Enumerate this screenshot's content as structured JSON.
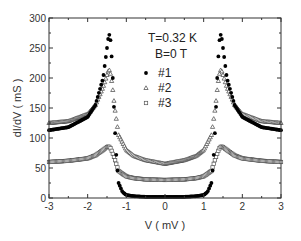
{
  "chart_data": {
    "type": "scatter",
    "title": "",
    "xlabel": "V ( mV )",
    "ylabel": "dI/dV ( mS )",
    "xlim": [
      -3,
      3
    ],
    "ylim": [
      0,
      300
    ],
    "xticks": [
      -3,
      -2,
      -1,
      0,
      1,
      2,
      3
    ],
    "yticks": [
      0,
      50,
      100,
      150,
      200,
      250,
      300
    ],
    "grid": false,
    "legend_position": "upper center",
    "annotations": [
      "T=0.32 K",
      "B=0 T"
    ],
    "series": [
      {
        "name": "#1",
        "marker": "filled-circle",
        "x": [
          -3.0,
          -2.5,
          -2.0,
          -1.8,
          -1.6,
          -1.5,
          -1.45,
          -1.4,
          -1.35,
          -1.3,
          -1.25,
          -1.2,
          -1.1,
          -1.0,
          -0.8,
          -0.5,
          0.0,
          0.5,
          0.8,
          1.0,
          1.1,
          1.2,
          1.25,
          1.3,
          1.35,
          1.4,
          1.45,
          1.5,
          1.6,
          1.8,
          2.0,
          2.5,
          3.0
        ],
        "y": [
          113,
          118,
          135,
          155,
          200,
          250,
          275,
          260,
          200,
          120,
          60,
          25,
          10,
          5,
          3,
          2,
          2,
          2,
          3,
          5,
          10,
          25,
          60,
          120,
          200,
          260,
          275,
          250,
          200,
          155,
          135,
          118,
          113
        ]
      },
      {
        "name": "#2",
        "marker": "open-triangle",
        "x": [
          -3.0,
          -2.5,
          -2.0,
          -1.8,
          -1.6,
          -1.5,
          -1.45,
          -1.4,
          -1.35,
          -1.3,
          -1.2,
          -1.0,
          -0.8,
          -0.5,
          0.0,
          0.5,
          0.8,
          1.0,
          1.2,
          1.3,
          1.35,
          1.4,
          1.45,
          1.5,
          1.6,
          1.8,
          2.0,
          2.5,
          3.0
        ],
        "y": [
          125,
          128,
          140,
          155,
          185,
          205,
          215,
          205,
          180,
          150,
          105,
          80,
          70,
          63,
          57,
          63,
          70,
          80,
          105,
          150,
          180,
          205,
          215,
          205,
          185,
          155,
          140,
          128,
          125
        ]
      },
      {
        "name": "#3",
        "marker": "open-square",
        "x": [
          -3.0,
          -2.5,
          -2.0,
          -1.8,
          -1.6,
          -1.5,
          -1.45,
          -1.4,
          -1.3,
          -1.2,
          -1.0,
          -0.8,
          -0.5,
          0.0,
          0.5,
          0.8,
          1.0,
          1.2,
          1.3,
          1.4,
          1.45,
          1.5,
          1.6,
          1.8,
          2.0,
          2.5,
          3.0
        ],
        "y": [
          60,
          62,
          66,
          71,
          80,
          85,
          86,
          82,
          65,
          45,
          36,
          33,
          31,
          30,
          31,
          33,
          36,
          45,
          65,
          82,
          86,
          85,
          80,
          71,
          66,
          62,
          60
        ]
      }
    ]
  },
  "legend": {
    "items": [
      {
        "label": "#1",
        "marker": "filled-circle"
      },
      {
        "label": "#2",
        "marker": "open-triangle"
      },
      {
        "label": "#3",
        "marker": "open-square"
      }
    ]
  },
  "annotation": {
    "temperature": "T=0.32 K",
    "field": "B=0 T"
  },
  "axes": {
    "xlabel": "V ( mV )",
    "ylabel": "dI/dV ( mS )"
  }
}
